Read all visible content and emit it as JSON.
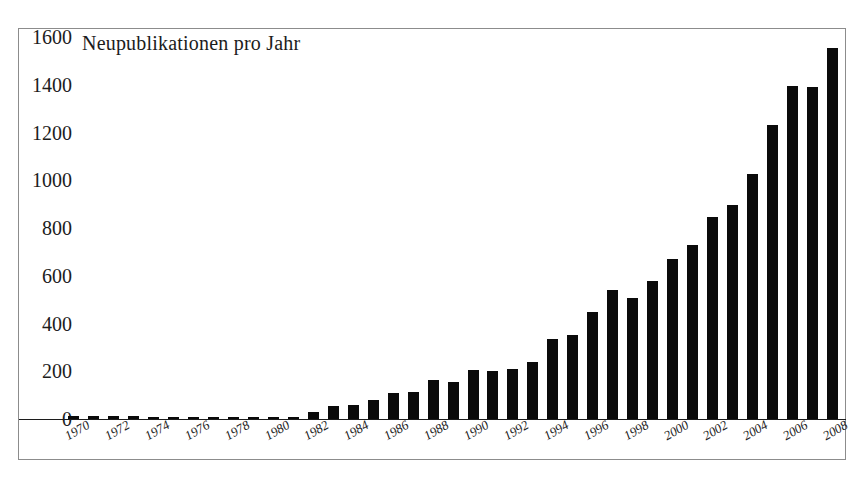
{
  "chart_data": {
    "type": "bar",
    "title": "Neupublikationen pro Jahr",
    "xlabel": "",
    "ylabel": "",
    "ylim": [
      0,
      1600
    ],
    "yticks": [
      0,
      200,
      400,
      600,
      800,
      1000,
      1200,
      1400,
      1600
    ],
    "ytick_labels": [
      "0",
      "200",
      "400",
      "600",
      "800",
      "1000",
      "1200",
      "1400",
      "1600"
    ],
    "grid": false,
    "legend": "none",
    "bar_color": "#0a0a0a",
    "background_color": "#ffffff",
    "frame_color": "#8c8c8c",
    "categories": [
      "1970",
      "1971",
      "1972",
      "1973",
      "1974",
      "1975",
      "1976",
      "1977",
      "1978",
      "1979",
      "1980",
      "1981",
      "1982",
      "1983",
      "1984",
      "1985",
      "1986",
      "1987",
      "1988",
      "1989",
      "1990",
      "1991",
      "1992",
      "1993",
      "1994",
      "1995",
      "1996",
      "1997",
      "1998",
      "1999",
      "2000",
      "2001",
      "2002",
      "2003",
      "2004",
      "2005",
      "2006",
      "2007",
      "2008"
    ],
    "xtick_labels": [
      "1970",
      "",
      "1972",
      "",
      "1974",
      "",
      "1976",
      "",
      "1978",
      "",
      "1980",
      "",
      "1982",
      "",
      "1984",
      "",
      "1986",
      "",
      "1988",
      "",
      "1990",
      "",
      "1992",
      "",
      "1994",
      "",
      "1996",
      "",
      "1998",
      "",
      "2000",
      "",
      "2002",
      "",
      "2004",
      "",
      "2006",
      "",
      "2008"
    ],
    "values": [
      12,
      13,
      14,
      12,
      10,
      9,
      8,
      10,
      9,
      8,
      9,
      10,
      30,
      55,
      58,
      80,
      110,
      112,
      165,
      155,
      205,
      200,
      210,
      240,
      335,
      350,
      450,
      540,
      505,
      580,
      670,
      730,
      845,
      895,
      1025,
      1230,
      1395,
      1390,
      1555
    ]
  }
}
